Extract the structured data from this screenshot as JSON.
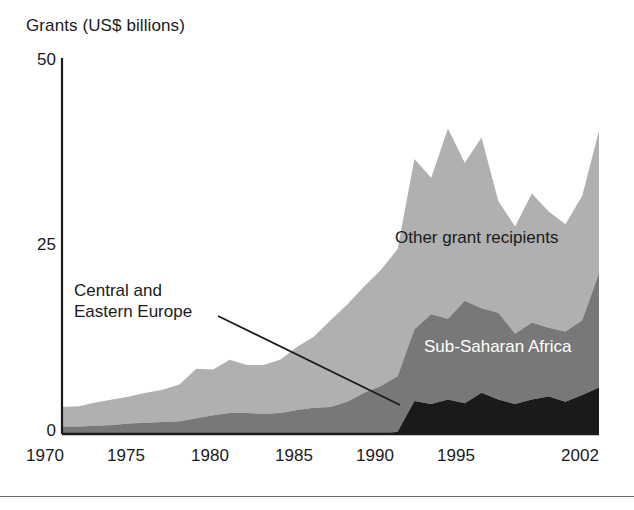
{
  "chart_data": {
    "type": "area",
    "stacked": true,
    "title": "",
    "ylabel": "Grants (US$ billions)",
    "xlabel": "",
    "ylim": [
      0,
      50
    ],
    "xlim": [
      1970,
      2002
    ],
    "yticks": [
      0,
      25,
      50
    ],
    "ytick_labels": [
      "0",
      "25",
      "50"
    ],
    "xticks": [
      1970,
      1975,
      1980,
      1985,
      1990,
      1995,
      2002
    ],
    "xtick_labels": [
      "1970",
      "1975",
      "1980",
      "1985",
      "1990",
      "1995",
      "2002"
    ],
    "grid": false,
    "legend": "inline-annotations",
    "x": [
      1970,
      1971,
      1972,
      1973,
      1974,
      1975,
      1976,
      1977,
      1978,
      1979,
      1980,
      1981,
      1982,
      1983,
      1984,
      1985,
      1986,
      1987,
      1988,
      1989,
      1990,
      1991,
      1992,
      1993,
      1994,
      1995,
      1996,
      1997,
      1998,
      1999,
      2000,
      2001,
      2002
    ],
    "series": [
      {
        "name": "Central and Eastern Europe",
        "color": "#1a1a1a",
        "values": [
          0,
          0,
          0,
          0,
          0,
          0,
          0,
          0,
          0,
          0,
          0,
          0,
          0,
          0,
          0,
          0,
          0,
          0,
          0,
          0,
          0.3,
          4.4,
          4.0,
          4.6,
          4.1,
          5.5,
          4.6,
          4.0,
          4.6,
          5.0,
          4.3,
          5.2,
          6.2
        ]
      },
      {
        "name": "Sub-Saharan Africa",
        "color": "#787878",
        "values": [
          1.0,
          1.0,
          1.1,
          1.2,
          1.4,
          1.5,
          1.6,
          1.7,
          2.1,
          2.5,
          2.8,
          2.8,
          2.7,
          2.8,
          3.2,
          3.5,
          3.6,
          4.3,
          5.5,
          6.4,
          7.4,
          9.6,
          12.0,
          10.8,
          13.7,
          11.3,
          11.6,
          9.4,
          10.3,
          9.2,
          9.4,
          10.0,
          15.3
        ]
      },
      {
        "name": "Other grant recipients",
        "color": "#b0b0b0",
        "values": [
          2.6,
          2.7,
          3.1,
          3.4,
          3.6,
          4.0,
          4.3,
          4.9,
          6.6,
          6.1,
          7.1,
          6.4,
          6.5,
          7.1,
          8.4,
          9.5,
          11.6,
          13.0,
          14.2,
          15.5,
          17.0,
          22.7,
          18.2,
          25.4,
          18.4,
          22.8,
          14.9,
          14.3,
          17.2,
          15.5,
          14.3,
          16.6,
          19.0
        ]
      }
    ],
    "annotations": [
      {
        "text_line1": "Central and",
        "text_line2": "Eastern Europe",
        "leader_from": [
          218,
          316
        ],
        "leader_to": [
          400,
          405
        ]
      }
    ]
  },
  "labels": {
    "axis_title": "Grants (US$ billions)",
    "y_ticks": [
      "50",
      "25",
      "0"
    ],
    "x_ticks": [
      "1970",
      "1975",
      "1980",
      "1985",
      "1990",
      "1995",
      "2002"
    ],
    "series_other": "Other grant recipients",
    "series_ssa": "Sub-Saharan Africa",
    "series_cee_line1": "Central and",
    "series_cee_line2": "Eastern Europe"
  },
  "colors": {
    "other_grant_recipients": "#b0b0b0",
    "sub_saharan_africa": "#787878",
    "central_eastern_europe": "#1a1a1a",
    "axis": "#1a1a1a",
    "background": "#ffffff"
  }
}
